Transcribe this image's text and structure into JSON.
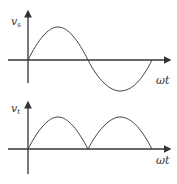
{
  "diagrams": [
    {
      "name": "source-voltage",
      "ylabel": "v",
      "ylabel_sub": "s",
      "xlabel": "ωt",
      "waveform": "sine"
    },
    {
      "name": "rectified-voltage",
      "ylabel": "v",
      "ylabel_sub": "t",
      "xlabel": "ωt",
      "waveform": "full-wave rectified sine"
    }
  ],
  "colors": {
    "line": "#333333",
    "background": "#ffffff"
  }
}
